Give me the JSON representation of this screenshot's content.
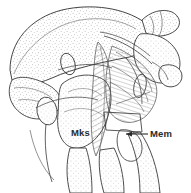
{
  "figure": {
    "type": "anatomical-line-drawing",
    "view": "lateral",
    "render_style": "stippled ink line drawing with cross-hatched muscle fibers",
    "background_color": "#ffffff",
    "ink_color": "#3a3a3a",
    "stipple_color": "#8e8e8e",
    "hatch_color": "#4a4a4a",
    "width_px": 191,
    "height_px": 193,
    "labels": [
      {
        "id": "mks",
        "text": "Mks",
        "placement": "inline-center-left",
        "x": 71,
        "y": 127,
        "has_leader_line": false,
        "has_arrowhead": false
      },
      {
        "id": "mem",
        "text": "Mem",
        "placement": "right-margin",
        "x": 150,
        "y": 128,
        "has_leader_line": true,
        "has_arrowhead": true,
        "leader_from_x": 148,
        "leader_to_x": 123,
        "leader_y": 134
      }
    ],
    "structures": [
      {
        "name": "cranial-dome",
        "region": "upper-left",
        "shading": "stipple"
      },
      {
        "name": "segmented-lobe-left",
        "region": "left",
        "shading": "stipple"
      },
      {
        "name": "anterior-process",
        "region": "top-right",
        "shading": "stipple"
      },
      {
        "name": "lateral-condyle-knob",
        "region": "right",
        "shading": "stipple"
      },
      {
        "name": "muscle-fiber-bundle-mks",
        "region": "center",
        "shading": "cross-hatch"
      },
      {
        "name": "muscle-fiber-bundle-mem",
        "region": "center-right",
        "shading": "cross-hatch"
      },
      {
        "name": "appendage-segment-lower-left",
        "region": "bottom-left",
        "shading": "stipple"
      },
      {
        "name": "appendage-segment-lower-center",
        "region": "bottom-center",
        "shading": "stipple"
      },
      {
        "name": "appendage-segment-lower-right",
        "region": "bottom-right",
        "shading": "stipple"
      }
    ]
  }
}
